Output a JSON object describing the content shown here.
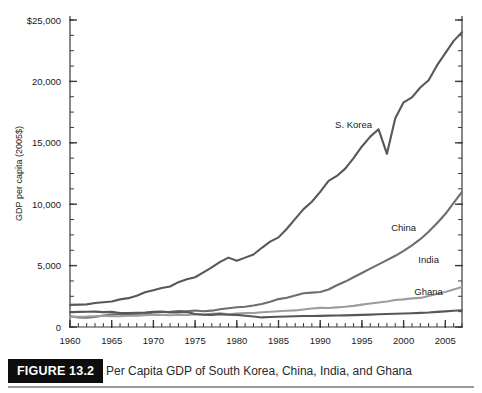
{
  "figure": {
    "number_label": "FIGURE 13.2",
    "caption": "Per Capita GDP of South Korea, China, India, and Ghana"
  },
  "chart_data": {
    "type": "line",
    "title": "",
    "xlabel": "",
    "ylabel": "GDP per capita (2005$)",
    "xlim": [
      1960,
      2007
    ],
    "ylim": [
      0,
      25000
    ],
    "grid": false,
    "legend_position": "inline-labels",
    "x_tick_labels": [
      "1960",
      "1965",
      "1970",
      "1975",
      "1980",
      "1985",
      "1990",
      "1995",
      "2000",
      "2005"
    ],
    "x_major_ticks": [
      1960,
      1965,
      1970,
      1975,
      1980,
      1985,
      1990,
      1995,
      2000,
      2005
    ],
    "x_minor_tick_step": 1,
    "y_tick_labels": [
      "0",
      "5,000",
      "10,000",
      "15,000",
      "20,000",
      "$25,000"
    ],
    "y_major_ticks": [
      0,
      5000,
      10000,
      15000,
      20000,
      25000
    ],
    "y_minor_tick_step": 1250,
    "colors": {
      "s_korea": "#58585a",
      "china": "#6e6e70",
      "india": "#9d9d9f",
      "ghana": "#57575a",
      "axis": "#3a3a3a"
    },
    "x": [
      1960,
      1961,
      1962,
      1963,
      1964,
      1965,
      1966,
      1967,
      1968,
      1969,
      1970,
      1971,
      1972,
      1973,
      1974,
      1975,
      1976,
      1977,
      1978,
      1979,
      1980,
      1981,
      1982,
      1983,
      1984,
      1985,
      1986,
      1987,
      1988,
      1989,
      1990,
      1991,
      1992,
      1993,
      1994,
      1995,
      1996,
      1997,
      1998,
      1999,
      2000,
      2001,
      2002,
      2003,
      2004,
      2005,
      2006,
      2007
    ],
    "series": [
      {
        "name": "S. Korea",
        "label": "S. Korea",
        "color": "#58585a",
        "values": [
          1800,
          1820,
          1840,
          1950,
          2020,
          2080,
          2250,
          2350,
          2550,
          2830,
          3000,
          3180,
          3300,
          3650,
          3880,
          4050,
          4450,
          4850,
          5300,
          5650,
          5400,
          5650,
          5900,
          6450,
          6950,
          7300,
          8000,
          8800,
          9600,
          10200,
          11000,
          11900,
          12300,
          12900,
          13750,
          14700,
          15500,
          16100,
          14100,
          17000,
          18300,
          18700,
          19500,
          20100,
          21300,
          22300,
          23300,
          24000
        ]
      },
      {
        "name": "China",
        "label": "China",
        "color": "#6e6e70",
        "values": [
          880,
          780,
          760,
          820,
          930,
          1010,
          1060,
          1000,
          960,
          1050,
          1180,
          1220,
          1230,
          1290,
          1280,
          1340,
          1280,
          1330,
          1440,
          1520,
          1610,
          1650,
          1750,
          1880,
          2060,
          2270,
          2380,
          2570,
          2750,
          2800,
          2850,
          3050,
          3400,
          3700,
          4050,
          4400,
          4750,
          5100,
          5450,
          5800,
          6200,
          6650,
          7150,
          7750,
          8450,
          9200,
          10100,
          11000
        ]
      },
      {
        "name": "India",
        "label": "India",
        "color": "#9d9d9f",
        "values": [
          830,
          840,
          850,
          880,
          920,
          870,
          870,
          920,
          930,
          970,
          1010,
          990,
          960,
          980,
          980,
          1030,
          1020,
          1070,
          1110,
          1030,
          1090,
          1130,
          1140,
          1200,
          1240,
          1280,
          1320,
          1350,
          1430,
          1500,
          1560,
          1550,
          1600,
          1650,
          1720,
          1820,
          1920,
          2000,
          2080,
          2200,
          2250,
          2330,
          2370,
          2530,
          2680,
          2850,
          3050,
          3250
        ]
      },
      {
        "name": "Ghana",
        "label": "Ghana",
        "color": "#57575a",
        "values": [
          1200,
          1230,
          1240,
          1250,
          1210,
          1230,
          1140,
          1130,
          1150,
          1170,
          1230,
          1250,
          1190,
          1190,
          1220,
          1060,
          1000,
          990,
          1050,
          1000,
          990,
          920,
          850,
          780,
          810,
          830,
          850,
          870,
          890,
          900,
          910,
          930,
          940,
          950,
          970,
          990,
          1010,
          1040,
          1060,
          1080,
          1100,
          1120,
          1150,
          1180,
          1230,
          1270,
          1320,
          1370
        ]
      }
    ],
    "annotations": [
      {
        "text": "S. Korea",
        "x": 1994,
        "y": 16200
      },
      {
        "text": "China",
        "x": 2000,
        "y": 7800
      },
      {
        "text": "India",
        "x": 2003,
        "y": 5200
      },
      {
        "text": "Ghana",
        "x": 2003,
        "y": 2600
      }
    ]
  }
}
